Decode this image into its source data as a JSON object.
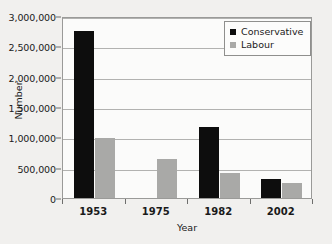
{
  "chart_data": {
    "type": "bar",
    "title": "",
    "xlabel": "Year",
    "ylabel": "Number",
    "categories": [
      "1953",
      "1975",
      "1982",
      "2002"
    ],
    "series": [
      {
        "name": "Conservative",
        "color": "#0d0d0d",
        "values": [
          2750000,
          null,
          1170000,
          310000
        ]
      },
      {
        "name": "Labour",
        "color": "#a9a9a7",
        "values": [
          990000,
          640000,
          420000,
          250000
        ]
      }
    ],
    "ylim": [
      0,
      3000000
    ],
    "ytick_labels": [
      "0",
      "500,000",
      "1,000,000",
      "1,500,000",
      "2,000,000",
      "2,500,000",
      "3,000,000"
    ],
    "ytick_values": [
      0,
      500000,
      1000000,
      1500000,
      2000000,
      2500000,
      3000000
    ],
    "grid": true,
    "legend_position": "top-right"
  },
  "legend": {
    "entries": [
      {
        "label": "Conservative"
      },
      {
        "label": "Labour"
      }
    ]
  }
}
